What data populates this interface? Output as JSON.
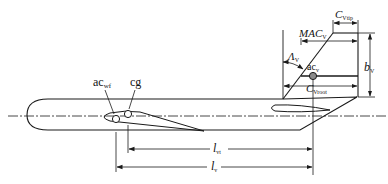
{
  "diagram": {
    "type": "aircraft-vertical-tail-geometry",
    "colors": {
      "line": "#1a1a1a",
      "ac_v_fill": "#8a8a8a",
      "background": "#ffffff"
    },
    "labels": {
      "ac_wf": {
        "main": "ac",
        "sub": "wf"
      },
      "cg": {
        "main": "cg"
      },
      "ac_v": {
        "main": "ac",
        "sub": "v"
      },
      "c_vtip": {
        "main": "C",
        "sub": "Vtip"
      },
      "mac_v": {
        "main": "MAC",
        "sub": "V"
      },
      "lambda_v": {
        "main": "Λ",
        "sub": "V"
      },
      "c_vroot": {
        "main": "C",
        "sub": "Vroot"
      },
      "b_v": {
        "main": "b",
        "sub": "V"
      },
      "l_vt": {
        "main": "l",
        "sub": "vt"
      },
      "l_v": {
        "main": "l",
        "sub": "v"
      }
    }
  }
}
